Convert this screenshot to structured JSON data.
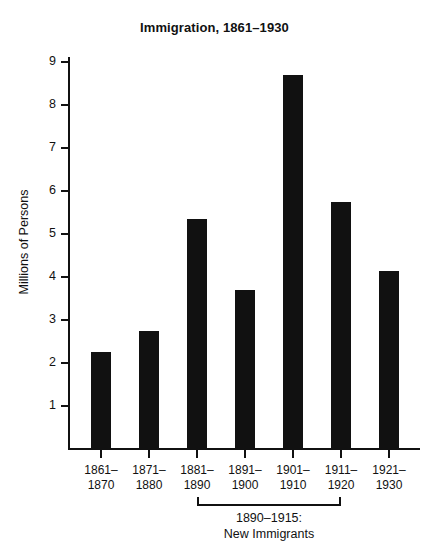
{
  "chart_data": {
    "type": "bar",
    "title": "Immigration, 1861–1930",
    "xlabel": "",
    "ylabel": "Millions of Persons",
    "categories": [
      "1861–1870",
      "1871–1880",
      "1881–1890",
      "1891–1900",
      "1901–1910",
      "1911–1920",
      "1921–1930"
    ],
    "category_lines": [
      [
        "1861–",
        "1870"
      ],
      [
        "1871–",
        "1880"
      ],
      [
        "1881–",
        "1890"
      ],
      [
        "1891–",
        "1900"
      ],
      [
        "1901–",
        "1910"
      ],
      [
        "1911–",
        "1920"
      ],
      [
        "1921–",
        "1930"
      ]
    ],
    "values": [
      2.25,
      2.75,
      5.35,
      3.7,
      8.7,
      5.75,
      4.15
    ],
    "ylim": [
      0,
      9
    ],
    "yticks": [
      1,
      2,
      3,
      4,
      5,
      6,
      7,
      8,
      9
    ],
    "ytick_labels": [
      "1",
      "2",
      "3",
      "4",
      "5",
      "6",
      "7",
      "8",
      "9"
    ],
    "grid": false,
    "legend": false,
    "bar_color": "#111111",
    "background_color": "#ffffff",
    "annotations": [
      {
        "text": "1890–1915:",
        "text_line2": "New Immigrants",
        "spans_categories": [
          "1881–1890",
          "1911–1920"
        ],
        "style": "bracket-below-axis"
      }
    ]
  },
  "figure": {
    "title": "Immigration, 1861–1930",
    "y_axis_title": "Millions of Persons",
    "annotation": {
      "line1": "1890–1915:",
      "line2": "New Immigrants"
    }
  }
}
